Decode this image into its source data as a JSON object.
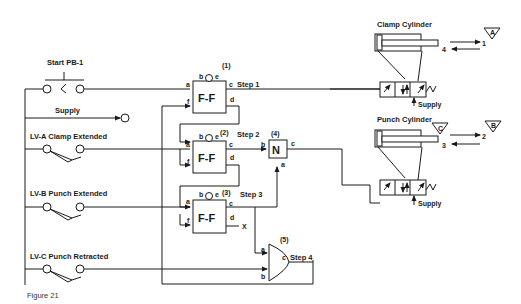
{
  "figure": {
    "caption": "Figure 21"
  },
  "inputs": {
    "start": "Start PB-1",
    "supply": "Supply",
    "lva": "LV-A Clamp Extended",
    "lvb": "LV-B Punch Extended",
    "lvc": "LV-C Punch Retracted"
  },
  "flipflops": [
    {
      "id": "(1)",
      "name": "F-F",
      "step": "Step 1",
      "ports": {
        "a": "a",
        "b": "b",
        "c": "c",
        "d": "d",
        "e": "e",
        "f": "f"
      }
    },
    {
      "id": "(2)",
      "name": "F-F",
      "step": "Step 2",
      "ports": {
        "a": "a",
        "b": "b",
        "c": "c",
        "d": "d",
        "e": "e",
        "f": "f"
      }
    },
    {
      "id": "(3)",
      "name": "F-F",
      "step": "Step 3",
      "ports": {
        "a": "a",
        "b": "b",
        "c": "c",
        "d": "d",
        "e": "e",
        "f": "f"
      },
      "d_output": "X"
    }
  ],
  "not_gate": {
    "id": "(4)",
    "name": "N",
    "ports": {
      "a": "a",
      "b": "b",
      "c": "c"
    }
  },
  "and_gate": {
    "id": "(5)",
    "step": "Step 4",
    "ports": {
      "a": "a",
      "b": "b",
      "c": "c"
    }
  },
  "cylinders": {
    "clamp": {
      "title": "Clamp Cylinder",
      "supply": "Supply",
      "out_label": "1",
      "in_label": "4",
      "marker": "A"
    },
    "punch": {
      "title": "Punch Cylinder",
      "supply": "Supply",
      "out_label": "2",
      "in_label": "3",
      "marker_left": "C",
      "marker_right": "B"
    }
  },
  "colors": {
    "line": "#1a1a1a",
    "background": "#ffffff"
  }
}
